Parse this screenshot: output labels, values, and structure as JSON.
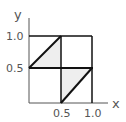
{
  "diagram": {
    "axes": {
      "x_label": "x",
      "y_label": "y",
      "x_ticks": [
        "0.5",
        "1.0"
      ],
      "y_ticks": [
        "1.0",
        "0.5"
      ]
    },
    "grid": {
      "cells": "2x2 unit square divided at 0.5",
      "range": [
        0,
        1
      ]
    },
    "shaded_regions": [
      {
        "name": "upper-left-triangle",
        "vertices": [
          [
            0,
            0.5
          ],
          [
            0.5,
            1.0
          ],
          [
            0.5,
            0.5
          ]
        ]
      },
      {
        "name": "lower-right-triangle",
        "vertices": [
          [
            0.5,
            0
          ],
          [
            1.0,
            0.5
          ],
          [
            0.5,
            0.5
          ]
        ]
      }
    ],
    "diagonal_segments": [
      {
        "from": [
          0,
          0.5
        ],
        "to": [
          0.5,
          1.0
        ]
      },
      {
        "from": [
          0.5,
          0
        ],
        "to": [
          1.0,
          0.5
        ]
      }
    ],
    "colors": {
      "line": "#111111",
      "axis": "#555555",
      "fill": "#eeeeee"
    }
  }
}
